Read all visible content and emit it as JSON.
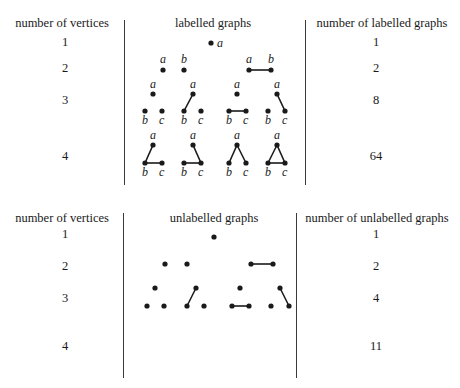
{
  "top_table": {
    "headers": {
      "vertices": "number of vertices",
      "graphs": "labelled graphs",
      "count": "number of labelled graphs"
    },
    "rows": [
      {
        "vertices": "1",
        "count": "1"
      },
      {
        "vertices": "2",
        "count": "2"
      },
      {
        "vertices": "3",
        "count": "8"
      },
      {
        "vertices": "4",
        "count": "64"
      }
    ]
  },
  "bottom_table": {
    "headers": {
      "vertices": "number of vertices",
      "graphs": "unlabelled graphs",
      "count": "number of unlabelled graphs"
    },
    "rows": [
      {
        "vertices": "1",
        "count": "1"
      },
      {
        "vertices": "2",
        "count": "2"
      },
      {
        "vertices": "3",
        "count": "4"
      },
      {
        "vertices": "4",
        "count": "11"
      }
    ]
  },
  "labelled_graphs": [
    {
      "nodes": [
        {
          "x": 211,
          "y": 43,
          "label": "a",
          "lx": 217,
          "ly": 47
        }
      ],
      "edges": []
    },
    {
      "nodes": [
        {
          "x": 163,
          "y": 70,
          "label": "a",
          "lx": 160,
          "ly": 63
        },
        {
          "x": 184,
          "y": 70,
          "label": "b",
          "lx": 181,
          "ly": 63
        }
      ],
      "edges": []
    },
    {
      "nodes": [
        {
          "x": 249,
          "y": 70,
          "label": "a",
          "lx": 246,
          "ly": 63
        },
        {
          "x": 271,
          "y": 70,
          "label": "b",
          "lx": 268,
          "ly": 63
        }
      ],
      "edges": [
        [
          0,
          1
        ]
      ]
    },
    {
      "nodes": [
        {
          "x": 153,
          "y": 94,
          "label": "a",
          "lx": 150,
          "ly": 88
        },
        {
          "x": 145,
          "y": 111,
          "label": "b",
          "lx": 142,
          "ly": 124
        },
        {
          "x": 162,
          "y": 111,
          "label": "c",
          "lx": 159,
          "ly": 124
        }
      ],
      "edges": []
    },
    {
      "nodes": [
        {
          "x": 193,
          "y": 94,
          "label": "a",
          "lx": 190,
          "ly": 88
        },
        {
          "x": 184,
          "y": 111,
          "label": "b",
          "lx": 181,
          "ly": 124
        },
        {
          "x": 201,
          "y": 111,
          "label": "c",
          "lx": 198,
          "ly": 124
        }
      ],
      "edges": [
        [
          0,
          1
        ]
      ]
    },
    {
      "nodes": [
        {
          "x": 237,
          "y": 94,
          "label": "a",
          "lx": 234,
          "ly": 88
        },
        {
          "x": 229,
          "y": 111,
          "label": "b",
          "lx": 226,
          "ly": 124
        },
        {
          "x": 246,
          "y": 111,
          "label": "c",
          "lx": 243,
          "ly": 124
        }
      ],
      "edges": [
        [
          1,
          2
        ]
      ]
    },
    {
      "nodes": [
        {
          "x": 277,
          "y": 94,
          "label": "a",
          "lx": 274,
          "ly": 88
        },
        {
          "x": 268,
          "y": 111,
          "label": "b",
          "lx": 265,
          "ly": 124
        },
        {
          "x": 285,
          "y": 111,
          "label": "c",
          "lx": 282,
          "ly": 124
        }
      ],
      "edges": [
        [
          0,
          2
        ]
      ]
    },
    {
      "nodes": [
        {
          "x": 153,
          "y": 145,
          "label": "a",
          "lx": 150,
          "ly": 139
        },
        {
          "x": 145,
          "y": 163,
          "label": "b",
          "lx": 142,
          "ly": 176
        },
        {
          "x": 162,
          "y": 163,
          "label": "c",
          "lx": 159,
          "ly": 176
        }
      ],
      "edges": [
        [
          0,
          1
        ],
        [
          1,
          2
        ]
      ]
    },
    {
      "nodes": [
        {
          "x": 193,
          "y": 145,
          "label": "a",
          "lx": 190,
          "ly": 139
        },
        {
          "x": 184,
          "y": 163,
          "label": "b",
          "lx": 181,
          "ly": 176
        },
        {
          "x": 201,
          "y": 163,
          "label": "c",
          "lx": 198,
          "ly": 176
        }
      ],
      "edges": [
        [
          0,
          2
        ],
        [
          1,
          2
        ]
      ]
    },
    {
      "nodes": [
        {
          "x": 237,
          "y": 145,
          "label": "a",
          "lx": 234,
          "ly": 139
        },
        {
          "x": 229,
          "y": 163,
          "label": "b",
          "lx": 226,
          "ly": 176
        },
        {
          "x": 246,
          "y": 163,
          "label": "c",
          "lx": 243,
          "ly": 176
        }
      ],
      "edges": [
        [
          0,
          1
        ],
        [
          0,
          2
        ]
      ]
    },
    {
      "nodes": [
        {
          "x": 277,
          "y": 145,
          "label": "a",
          "lx": 274,
          "ly": 139
        },
        {
          "x": 268,
          "y": 163,
          "label": "b",
          "lx": 265,
          "ly": 176
        },
        {
          "x": 285,
          "y": 163,
          "label": "c",
          "lx": 282,
          "ly": 176
        }
      ],
      "edges": [
        [
          0,
          1
        ],
        [
          0,
          2
        ],
        [
          1,
          2
        ]
      ]
    }
  ],
  "unlabelled_graphs": [
    {
      "nodes": [
        {
          "x": 214,
          "y": 237
        }
      ],
      "edges": []
    },
    {
      "nodes": [
        {
          "x": 165,
          "y": 264
        },
        {
          "x": 187,
          "y": 264
        }
      ],
      "edges": []
    },
    {
      "nodes": [
        {
          "x": 251,
          "y": 264
        },
        {
          "x": 273,
          "y": 264
        }
      ],
      "edges": [
        [
          0,
          1
        ]
      ]
    },
    {
      "nodes": [
        {
          "x": 155,
          "y": 288
        },
        {
          "x": 147,
          "y": 306
        },
        {
          "x": 164,
          "y": 306
        }
      ],
      "edges": []
    },
    {
      "nodes": [
        {
          "x": 196,
          "y": 288
        },
        {
          "x": 187,
          "y": 306
        },
        {
          "x": 204,
          "y": 306
        }
      ],
      "edges": [
        [
          0,
          1
        ]
      ]
    },
    {
      "nodes": [
        {
          "x": 240,
          "y": 288
        },
        {
          "x": 232,
          "y": 306
        },
        {
          "x": 249,
          "y": 306
        }
      ],
      "edges": [
        [
          1,
          2
        ]
      ]
    },
    {
      "nodes": [
        {
          "x": 280,
          "y": 288
        },
        {
          "x": 271,
          "y": 306
        },
        {
          "x": 289,
          "y": 306
        }
      ],
      "edges": [
        [
          0,
          2
        ]
      ]
    }
  ],
  "colors": {
    "ink": "#1a1a1a",
    "rule": "#3a3a3a",
    "background": "#ffffff"
  }
}
